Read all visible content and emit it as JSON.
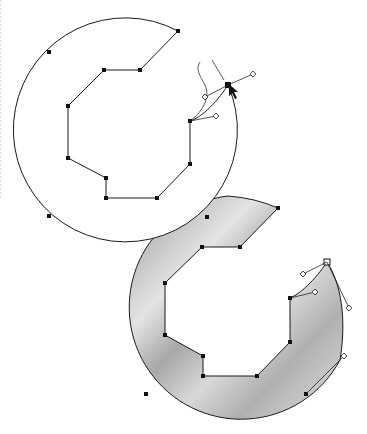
{
  "diagram": {
    "colors": {
      "stroke": "#1a1a1a",
      "anchor": "#111111",
      "fill_light": "#eeeeee",
      "fill_mid": "#c4c4c4",
      "fill_dark": "#9a9a9a",
      "background": "#ffffff"
    },
    "top_shape": {
      "label": "outline-path",
      "anchors": [
        [
          178,
          31
        ],
        [
          140,
          70
        ],
        [
          104,
          70
        ],
        [
          68,
          106
        ],
        [
          68,
          158
        ],
        [
          106,
          178
        ],
        [
          106,
          198
        ],
        [
          157,
          198
        ],
        [
          190,
          164
        ],
        [
          190,
          121
        ],
        [
          228,
          85
        ]
      ],
      "arc_anchors": [
        [
          49,
          52
        ],
        [
          49,
          216
        ],
        [
          207,
          217
        ]
      ],
      "handles": [
        [
          253,
          74
        ],
        [
          205,
          97
        ],
        [
          216,
          116
        ]
      ],
      "cursor": [
        229,
        84
      ]
    },
    "bottom_shape": {
      "label": "filled-path",
      "anchors": [
        [
          278,
          208
        ],
        [
          240,
          247
        ],
        [
          202,
          247
        ],
        [
          165,
          283
        ],
        [
          165,
          335
        ],
        [
          203,
          356
        ],
        [
          203,
          376
        ],
        [
          257,
          376
        ],
        [
          290,
          342
        ],
        [
          290,
          298
        ]
      ],
      "selected_anchor": [
        327,
        262
      ],
      "arc_anchors": [
        [
          146,
          394
        ],
        [
          306,
          394
        ]
      ],
      "handles": [
        [
          303,
          274
        ],
        [
          315,
          292
        ],
        [
          349,
          308
        ],
        [
          344,
          356
        ]
      ]
    }
  }
}
